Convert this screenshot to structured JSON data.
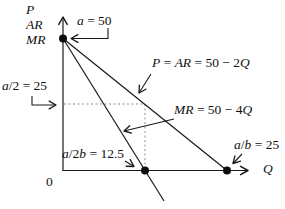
{
  "figure": {
    "background": "#ffffff",
    "ink_color": "#1a1a1a",
    "dash_color": "#8f8f8f",
    "dot_color": "#0d0d0d",
    "y_axis_title_lines": [
      "P",
      "AR",
      "MR"
    ],
    "x_axis_title": "Q",
    "origin_label": "0",
    "labels": {
      "a_intercept": [
        {
          "t": "a",
          "i": 1
        },
        {
          "t": " = 50",
          "i": 0
        }
      ],
      "half_price": [
        {
          "t": "a",
          "i": 1
        },
        {
          "t": "/2 = 25",
          "i": 0
        }
      ],
      "demand_eq": [
        {
          "t": "P",
          "i": 1
        },
        {
          "t": " = ",
          "i": 0
        },
        {
          "t": "AR",
          "i": 1
        },
        {
          "t": " = 50 − 2",
          "i": 0
        },
        {
          "t": "Q",
          "i": 1
        }
      ],
      "mr_eq": [
        {
          "t": "MR",
          "i": 1
        },
        {
          "t": " = 50 − 4",
          "i": 0
        },
        {
          "t": "Q",
          "i": 1
        }
      ],
      "mr_q_intercept": [
        {
          "t": "a",
          "i": 1
        },
        {
          "t": "/2",
          "i": 0
        },
        {
          "t": "b",
          "i": 1
        },
        {
          "t": " = 12.5",
          "i": 0
        }
      ],
      "demand_q_intercept": [
        {
          "t": "a",
          "i": 1
        },
        {
          "t": "/",
          "i": 0
        },
        {
          "t": "b",
          "i": 1
        },
        {
          "t": " = 25",
          "i": 0
        }
      ]
    }
  },
  "chart_data": {
    "type": "line",
    "title": "",
    "xlabel": "Q",
    "ylabel": "P, AR, MR",
    "xlim": [
      0,
      28
    ],
    "ylim": [
      0,
      55
    ],
    "grid": false,
    "legend_position": "none",
    "series": [
      {
        "name": "P = AR = 50 − 2Q",
        "x": [
          0,
          25
        ],
        "y": [
          50,
          0
        ]
      },
      {
        "name": "MR = 50 − 4Q",
        "x": [
          0,
          12.5
        ],
        "y": [
          50,
          0
        ]
      }
    ],
    "key_points": [
      {
        "label": "a = 50",
        "x": 0,
        "y": 50
      },
      {
        "label": "a/2 = 25",
        "x": 0,
        "y": 25
      },
      {
        "label": "a/2b = 12.5",
        "x": 12.5,
        "y": 0
      },
      {
        "label": "a/b = 25",
        "x": 25,
        "y": 0
      }
    ],
    "dashed_guides": [
      {
        "from": [
          0,
          25
        ],
        "to": [
          12.5,
          25
        ]
      },
      {
        "from": [
          12.5,
          25
        ],
        "to": [
          12.5,
          0
        ]
      }
    ]
  }
}
